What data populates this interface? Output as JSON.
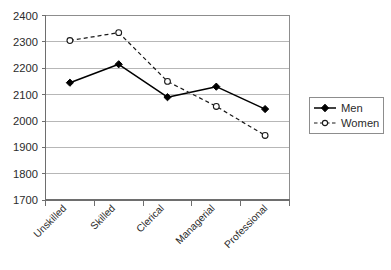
{
  "chart_data": {
    "type": "line",
    "title": "",
    "xlabel": "",
    "ylabel": "",
    "categories": [
      "Unskilled",
      "Skilled",
      "Clerical",
      "Managerial",
      "Professional"
    ],
    "series": [
      {
        "name": "Men",
        "values": [
          2145,
          2215,
          2090,
          2130,
          2045
        ],
        "marker": "filled-diamond",
        "line_style": "solid",
        "color": "#000000"
      },
      {
        "name": "Women",
        "values": [
          2305,
          2335,
          2150,
          2055,
          1945
        ],
        "marker": "open-circle",
        "line_style": "dashed",
        "color": "#1a1a1a"
      }
    ],
    "ylim": [
      1700,
      2400
    ],
    "ytick_step": 100,
    "yticks": [
      1700,
      1800,
      1900,
      2000,
      2100,
      2200,
      2300,
      2400
    ],
    "ytick_labels": [
      "1700",
      "1800",
      "1900",
      "2000",
      "2100",
      "2200",
      "2300",
      "2400"
    ],
    "grid": true,
    "grid_axis": "y",
    "legend_position": "right",
    "xtick_label_rotation": -45
  },
  "legend": {
    "entries": [
      {
        "label": "Men"
      },
      {
        "label": "Women"
      }
    ]
  },
  "axes": {
    "y": {
      "labels": [
        "2400",
        "2300",
        "2200",
        "2100",
        "2000",
        "1900",
        "1800",
        "1700"
      ]
    },
    "x": {
      "labels": [
        "Unskilled",
        "Skilled",
        "Clerical",
        "Managerial",
        "Professional"
      ]
    }
  },
  "caption": {
    "text": ""
  }
}
